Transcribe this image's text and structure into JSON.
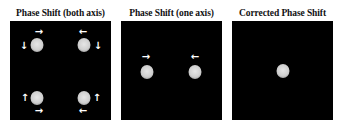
{
  "panels": [
    {
      "title": "Phase Shift (both axis)",
      "left": 10,
      "spots": [
        {
          "x": 27,
          "y": 24
        },
        {
          "x": 74,
          "y": 24
        },
        {
          "x": 27,
          "y": 77
        },
        {
          "x": 74,
          "y": 77
        }
      ],
      "arrows": [
        {
          "glyph": "→",
          "direction": "right",
          "x": 29,
          "y": 11
        },
        {
          "glyph": "↓",
          "direction": "down",
          "x": 14,
          "y": 25
        },
        {
          "glyph": "←",
          "direction": "left",
          "x": 73,
          "y": 11
        },
        {
          "glyph": "↓",
          "direction": "down",
          "x": 88,
          "y": 25
        },
        {
          "glyph": "↑",
          "direction": "up",
          "x": 15,
          "y": 77
        },
        {
          "glyph": "→",
          "direction": "right",
          "x": 29,
          "y": 90
        },
        {
          "glyph": "↑",
          "direction": "up",
          "x": 87,
          "y": 77
        },
        {
          "glyph": "←",
          "direction": "left",
          "x": 73,
          "y": 90
        }
      ]
    },
    {
      "title": "Phase Shift (one axis)",
      "left": 121,
      "spots": [
        {
          "x": 26,
          "y": 51
        },
        {
          "x": 74,
          "y": 51
        }
      ],
      "arrows": [
        {
          "glyph": "→",
          "direction": "right",
          "x": 25,
          "y": 36
        },
        {
          "glyph": "←",
          "direction": "left",
          "x": 74,
          "y": 36
        }
      ]
    },
    {
      "title": "Corrected Phase Shift",
      "left": 232,
      "spots": [
        {
          "x": 51,
          "y": 50
        }
      ],
      "arrows": []
    }
  ],
  "colors": {
    "panel_bg": "#000000",
    "spot": "#d8d8d8",
    "arrow": "#ffffff",
    "title": "#111111"
  }
}
